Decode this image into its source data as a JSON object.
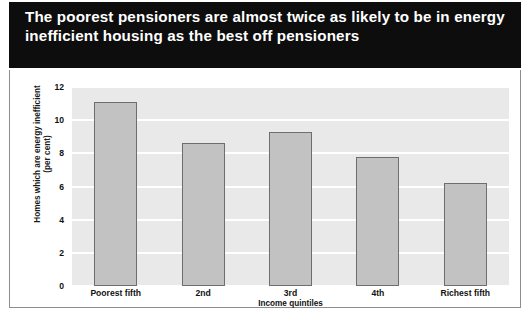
{
  "title": "The poorest pensioners are almost twice as likely to be in energy inefficient housing as the best off pensioners",
  "colors": {
    "title_band_bg": "#0d0d0d",
    "title_text": "#ffffff",
    "plot_bg": "#e9e9e9",
    "gridline": "#ffffff",
    "bar_fill": "#c2c2c2",
    "bar_border": "#6e6e6e",
    "frame_border": "#8d8d8d",
    "axis_text": "#111111"
  },
  "axis": {
    "ylabel_line1": "Homes which are energy inefficient",
    "ylabel_line2": "(per cent)",
    "xlabel": "Income quintiles",
    "yticks": [
      "12",
      "10",
      "8",
      "6",
      "4",
      "2",
      "0"
    ]
  },
  "chart_data": {
    "type": "bar",
    "title": "The poorest pensioners are almost twice as likely to be in energy inefficient housing as the best off pensioners",
    "categories": [
      "Poorest fifth",
      "2nd",
      "3rd",
      "4th",
      "Richest fifth"
    ],
    "values": [
      11.1,
      8.6,
      9.3,
      7.8,
      6.2
    ],
    "xlabel": "Income quintiles",
    "ylabel": "Homes which are energy inefficient (per cent)",
    "ylim": [
      0,
      12
    ],
    "ytick_values": [
      0,
      2,
      4,
      6,
      8,
      10,
      12
    ],
    "grid": true,
    "legend": false
  }
}
